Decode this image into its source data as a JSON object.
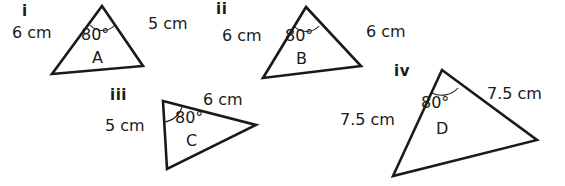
{
  "figure": {
    "stroke_color": "#1a1a1a",
    "background_color": "#ffffff",
    "width": 565,
    "height": 186
  },
  "triangles": [
    {
      "numeral": "i",
      "name": "A",
      "angle": "80°",
      "left_side": "6 cm",
      "right_side": "5 cm"
    },
    {
      "numeral": "ii",
      "name": "B",
      "angle": "80°",
      "left_side": "6 cm",
      "right_side": "6 cm"
    },
    {
      "numeral": "iii",
      "name": "C",
      "angle": "80°",
      "left_side": "5 cm",
      "right_side": "6 cm"
    },
    {
      "numeral": "iv",
      "name": "D",
      "angle": "80°",
      "left_side": "7.5 cm",
      "right_side": "7.5 cm"
    }
  ]
}
